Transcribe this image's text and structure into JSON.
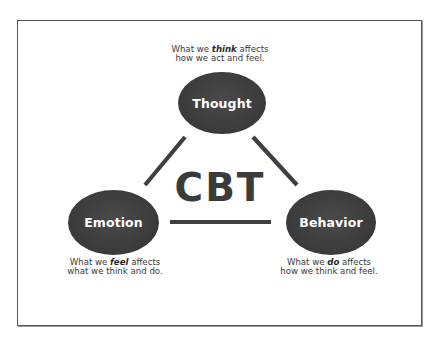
{
  "diagram": {
    "title": "CBT",
    "nodes": [
      {
        "id": "thought",
        "label": "Thought",
        "caption_before": "What we ",
        "caption_emphasis": "think",
        "caption_after": " affects",
        "caption_line2": "how we act and feel."
      },
      {
        "id": "emotion",
        "label": "Emotion",
        "caption_before": "What we ",
        "caption_emphasis": "feel",
        "caption_after": " affects",
        "caption_line2": "what we think and do."
      },
      {
        "id": "behavior",
        "label": "Behavior",
        "caption_before": "What we ",
        "caption_emphasis": "do",
        "caption_after": " affects",
        "caption_line2": "how we think and feel."
      }
    ],
    "edges": [
      {
        "from": "thought",
        "to": "emotion"
      },
      {
        "from": "thought",
        "to": "behavior"
      },
      {
        "from": "emotion",
        "to": "behavior"
      }
    ],
    "colors": {
      "node_fill": "#3d3d3d",
      "node_text": "#ffffff",
      "connector": "#3f3f3f",
      "title_text": "#3b3b3b",
      "caption_text": "#3a3a3a",
      "frame_border": "#555555"
    }
  }
}
